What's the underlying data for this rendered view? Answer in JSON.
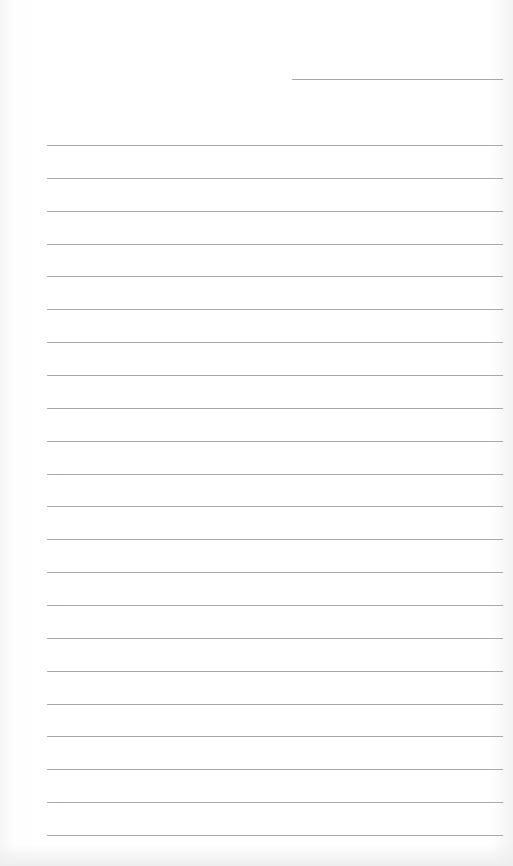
{
  "page": {
    "type": "lined-paper",
    "background": "#ffffff",
    "line_color": "#9a9a9a",
    "header_line": {
      "top": 79,
      "left": 292,
      "right": 503
    },
    "ruled_lines": {
      "count": 22,
      "first_top": 145,
      "spacing": 32.86,
      "left": 47,
      "right": 503
    }
  }
}
